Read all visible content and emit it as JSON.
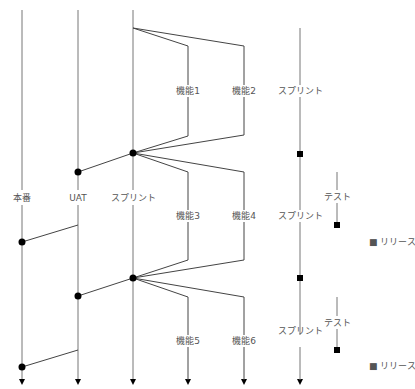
{
  "diagram": {
    "colors": {
      "line": "#777777",
      "branch_line": "#444444",
      "node": "#000000",
      "text": "#555555"
    },
    "lanes": [
      {
        "id": "prod",
        "label": "本番",
        "x": 22
      },
      {
        "id": "uat",
        "label": "UAT",
        "x": 78
      },
      {
        "id": "sprint",
        "label": "スプリント",
        "x": 133
      }
    ],
    "features": [
      {
        "label": "機能1"
      },
      {
        "label": "機能2"
      },
      {
        "label": "機能3"
      },
      {
        "label": "機能4"
      },
      {
        "label": "機能5"
      },
      {
        "label": "機能6"
      }
    ],
    "timeline": {
      "sprint_labels": [
        "スプリント",
        "スプリント",
        "スプリント"
      ],
      "test_labels": [
        "テスト",
        "テスト"
      ],
      "release_labels": [
        "■ リリース",
        "■ リリース"
      ]
    }
  }
}
